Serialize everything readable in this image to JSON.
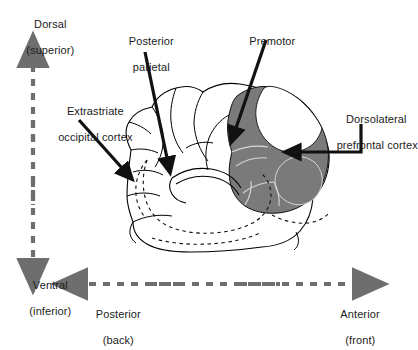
{
  "figure": {
    "background_color": "#ffffff",
    "ink_color": "#1b1b1b",
    "shaded_region_color": "#7a7a7a",
    "axis_arrow_color": "#6e6e6e",
    "outline_color": "#000000"
  },
  "axes": {
    "vertical": {
      "name": "dorsal-ventral-axis",
      "style": "dashed double-headed arrow",
      "top_label_line1": "Dorsal",
      "top_label_line2": "(superior)",
      "bottom_label_line1": "Ventral",
      "bottom_label_line2": "(inferior)"
    },
    "horizontal": {
      "name": "posterior-anterior-axis",
      "style": "dashed double-headed arrow",
      "left_label_line1": "Posterior",
      "left_label_line2": "(back)",
      "right_label_line1": "Anterior",
      "right_label_line2": "(front)"
    }
  },
  "callouts": [
    {
      "id": "posterior-parietal",
      "line1": "Posterior",
      "line2": "parietal",
      "leader": "solid arrow, down-right",
      "shaded": false
    },
    {
      "id": "premotor",
      "line1": "Premotor",
      "line2": "",
      "leader": "solid arrow, down-left",
      "shaded": true
    },
    {
      "id": "extrastriate-occipital-cortex",
      "line1": "Extrastriate",
      "line2": "occipital cortex",
      "leader": "solid arrow, down-right",
      "shaded": false
    },
    {
      "id": "dorsolateral-prefrontal-cortex",
      "line1": "Dorsolateral",
      "line2": "prefrontal cortex",
      "leader": "solid elbow arrow, pointing left",
      "shaded": true
    }
  ]
}
